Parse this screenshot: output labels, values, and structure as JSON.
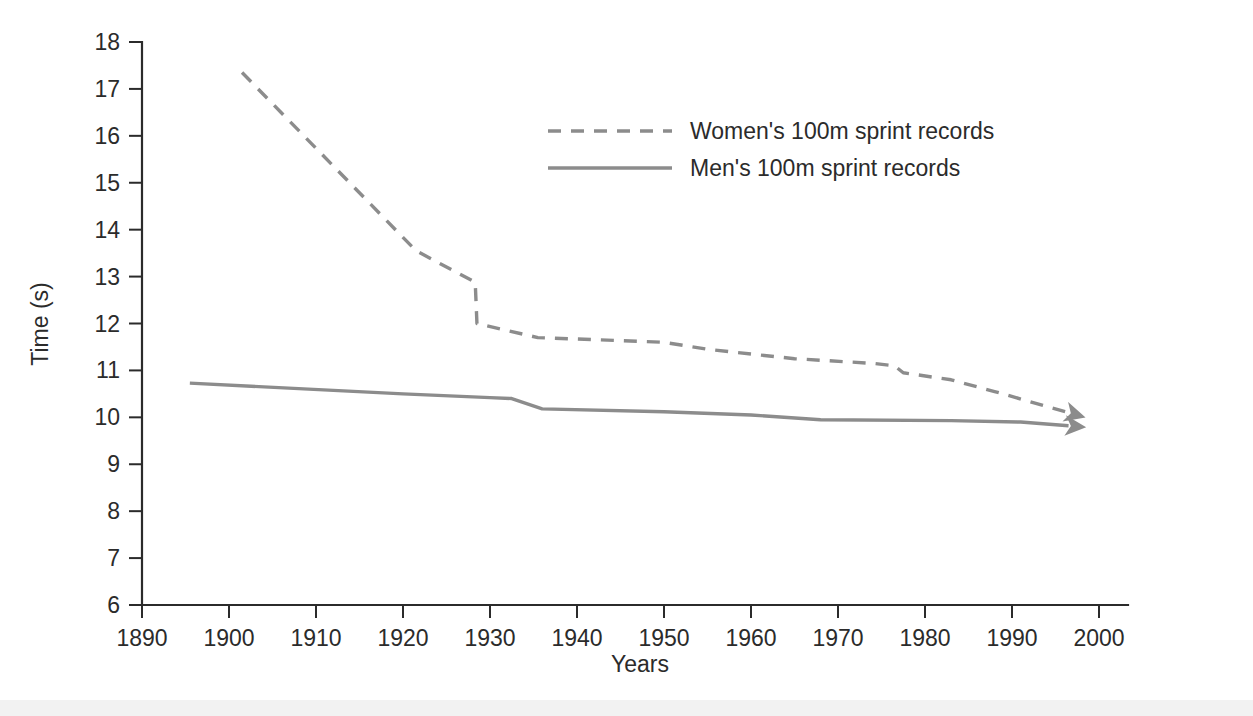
{
  "figure": {
    "background_color": "#ffffff",
    "line_color": "#8c8c8c",
    "axis_color": "#2b2b2b"
  },
  "chart_data": {
    "type": "line",
    "title": "",
    "xlabel": "Years",
    "ylabel": "Time (s)",
    "xlim": [
      1890,
      2005
    ],
    "ylim": [
      6,
      18
    ],
    "xticks": [
      1890,
      1900,
      1910,
      1920,
      1930,
      1940,
      1950,
      1960,
      1970,
      1980,
      1990,
      2000
    ],
    "yticks": [
      6,
      7,
      8,
      9,
      10,
      11,
      12,
      13,
      14,
      15,
      16,
      17,
      18
    ],
    "xtick_labels": [
      "1890",
      "1900",
      "1910",
      "1920",
      "1930",
      "1940",
      "1950",
      "1960",
      "1970",
      "1980",
      "1990",
      "2000"
    ],
    "ytick_labels": [
      "6",
      "7",
      "8",
      "9",
      "10",
      "11",
      "12",
      "13",
      "14",
      "15",
      "16",
      "17",
      "18"
    ],
    "grid": false,
    "legend_position": "upper-center",
    "series": [
      {
        "name": "Women's 100m sprint records",
        "style": "dashed",
        "color": "#8c8c8c",
        "arrow_end": true,
        "x": [
          1901.5,
          1921.5,
          1928.3,
          1928.5,
          1932.0,
          1935.5,
          1950.0,
          1955.0,
          1965.0,
          1974.0,
          1976.5,
          1977.5,
          1983.0,
          1988.0,
          1996.5
        ],
        "y": [
          17.35,
          13.55,
          12.88,
          12.0,
          11.85,
          11.7,
          11.6,
          11.45,
          11.25,
          11.15,
          11.1,
          10.95,
          10.8,
          10.55,
          10.1
        ]
      },
      {
        "name": "Men's 100m sprint records",
        "style": "solid",
        "color": "#8c8c8c",
        "arrow_end": true,
        "x": [
          1895.5,
          1920.0,
          1930.0,
          1932.5,
          1936.0,
          1950.0,
          1960.0,
          1968.0,
          1983.0,
          1991.0,
          1996.5
        ],
        "y": [
          10.73,
          10.5,
          10.42,
          10.4,
          10.18,
          10.12,
          10.05,
          9.95,
          9.93,
          9.9,
          9.82
        ]
      }
    ]
  },
  "legend": {
    "entries": [
      {
        "label": "Women's 100m sprint records",
        "style": "dashed"
      },
      {
        "label": "Men's 100m sprint records",
        "style": "solid"
      }
    ]
  },
  "axes": {
    "y_axis_title": "Time (s)",
    "x_axis_title": "Years"
  }
}
